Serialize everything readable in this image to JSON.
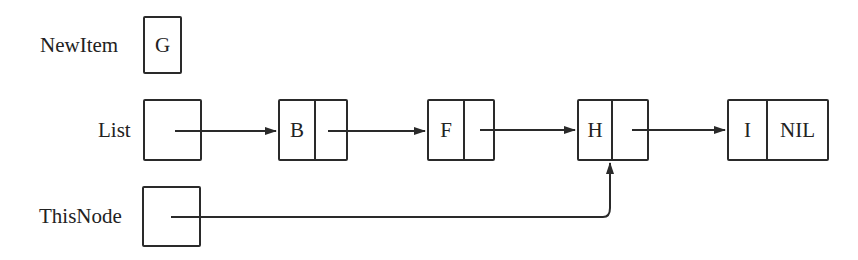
{
  "diagram": {
    "type": "linked-list",
    "pointers": {
      "newitem": {
        "label": "NewItem",
        "value": "G"
      },
      "list": {
        "label": "List"
      },
      "thisnode": {
        "label": "ThisNode"
      }
    },
    "nodes": [
      {
        "data": "B",
        "next": ""
      },
      {
        "data": "F",
        "next": ""
      },
      {
        "data": "H",
        "next": ""
      },
      {
        "data": "I",
        "next": "NIL"
      }
    ],
    "edges": [
      {
        "from": "List",
        "to": "B"
      },
      {
        "from": "B",
        "to": "F"
      },
      {
        "from": "F",
        "to": "H"
      },
      {
        "from": "H",
        "to": "I"
      },
      {
        "from": "ThisNode",
        "to": "H"
      }
    ],
    "colors": {
      "stroke": "#2a2a2a",
      "background": "#ffffff"
    }
  }
}
